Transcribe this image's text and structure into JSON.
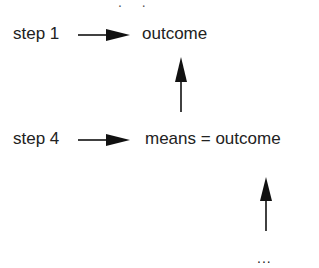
{
  "diagram": {
    "top_partial_text": ". .",
    "row1": {
      "left": "step 1",
      "right": "outcome"
    },
    "row2": {
      "left": "step 4",
      "right": "means = outcome"
    },
    "continuation": "..."
  }
}
